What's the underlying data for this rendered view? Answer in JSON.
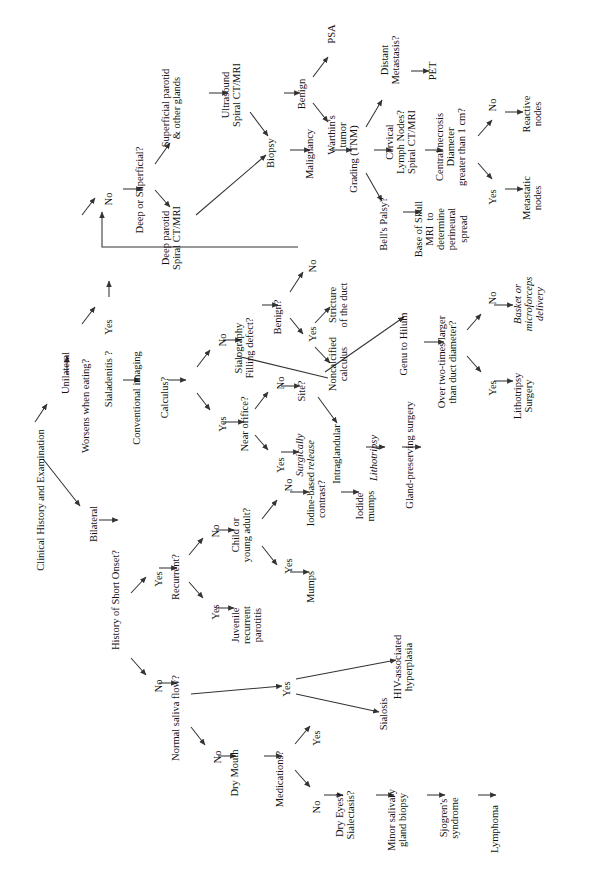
{
  "figure": {
    "type": "flowchart",
    "orientation": "rotated-90-ccw",
    "background": "#ffffff",
    "line_color": "#333333",
    "text_color": "#111111"
  },
  "nodes": {
    "root": "Clinical History and Examination",
    "unilateral": "Unilateral",
    "bilateral": "Bilateral",
    "worsens_eating": "Worsens when eating?",
    "we_yes": "Yes",
    "we_no": "No",
    "sialadenitis": "Sialadenitis ?",
    "conventional_imaging": "Conventional imaging",
    "calculus_q": "Calculus?",
    "calc_no": "No",
    "calc_yes": "Yes",
    "sialography": "Sialography\nFilling defect?",
    "benign_q": "Benign?",
    "benign_no": "No",
    "benign_yes": "Yes",
    "stricture": "Stricture\nof the duct",
    "noncalcified": "Noncalcified\ncalculus",
    "near_orifice": "Near orifice?",
    "no_no": "No",
    "no_yes": "Yes",
    "surgically_release": "Surgically\nrelease",
    "site_q": "Site?",
    "intraglandular": "Intraglandular",
    "lithotripsy1": "Lithotripsy",
    "gland_preserving": "Gland-preserving surgery",
    "genu_hilum": "Genu to Hilum",
    "over_two_times": "Over two-times larger\nthan duct diameter?",
    "ott_no": "No",
    "ott_yes": "Yes",
    "basket": "Basket or\nmicroforceps\ndelivery",
    "lithotripsy2": "Lithotripsy\nSurgery",
    "deep_or_superficial": "Deep or Superficial?",
    "superficial_parotid": "Superficial parotid\n& other glands",
    "deep_parotid": "Deep parotid\nSpiral CT/MRI",
    "ultrasound": "Ultrasound\nSpiral CT/MRI",
    "biopsy": "Biopsy",
    "benign": "Benign",
    "psa": "PSA",
    "warthins": "Warthin's\ntumor",
    "malignancy": "Malignancy",
    "grading": "Grading (TNM)",
    "distant_mets": "Distant\nMetastasis?",
    "pet": "PET",
    "cervical_nodes": "Cervical\nLymph Nodes?\nSpiral CT/MRI",
    "central_necrosis": "Central necrosis\nDiameter\ngreater than 1 cm?",
    "cn_no": "No",
    "cn_yes": "Yes",
    "reactive_nodes": "Reactive\nnodes",
    "metastatic_nodes": "Metastatic\nnodes",
    "bells_palsy": "Bell's Palsy?",
    "base_of_skull": "Base of Skull\nMRI  to\ndetermine\nperineural\nspread",
    "short_onset": "History of Short Onset?",
    "so_yes": "Yes",
    "so_no": "No",
    "recurrent_q": "Recurrent?",
    "rec_no": "No",
    "rec_yes": "Yes",
    "juvenile": "Juvenile\nrecurrent\nparotitis",
    "child_young": "Child or\nyoung adult?",
    "cy_no": "No",
    "cy_yes": "Yes",
    "mumps": "Mumps",
    "iodine_contrast": "Iodine-based\ncontrast?",
    "iodide_mumps": "Iodide\nmumps",
    "normal_saliva": "Normal saliva flow?",
    "ns_yes": "Yes",
    "ns_no": "No",
    "hiv": "HIV-associated\nhyperplasia",
    "sialosis": "Sialosis",
    "dry_mouth": "Dry Mouth",
    "medications": "Medications?",
    "med_yes": "Yes",
    "med_no": "No",
    "dry_eyes": "Dry Eyes?\nSialectasis?",
    "minor_biopsy": "Minor salivary\ngland biopsy",
    "sjogrens": "Sjogren's\nsyndrome",
    "lymphoma": "Lymphoma"
  },
  "edges": [
    {
      "from": "root",
      "to": "unilateral",
      "label": ""
    },
    {
      "from": "root",
      "to": "bilateral",
      "label": ""
    },
    {
      "from": "unilateral",
      "to": "worsens_eating",
      "label": ""
    },
    {
      "from": "worsens_eating",
      "to": "we_yes",
      "label": ""
    },
    {
      "from": "worsens_eating",
      "to": "we_no",
      "label": ""
    },
    {
      "from": "we_yes",
      "to": "sialadenitis",
      "label": ""
    },
    {
      "from": "sialadenitis",
      "to": "conventional_imaging",
      "label": ""
    },
    {
      "from": "conventional_imaging",
      "to": "calculus_q",
      "label": ""
    },
    {
      "from": "calculus_q",
      "to": "calc_no",
      "label": ""
    },
    {
      "from": "calculus_q",
      "to": "calc_yes",
      "label": ""
    },
    {
      "from": "calc_no",
      "to": "sialography",
      "label": ""
    },
    {
      "from": "sialography",
      "to": "benign_q",
      "label": ""
    },
    {
      "from": "benign_q",
      "to": "benign_no",
      "label": ""
    },
    {
      "from": "benign_q",
      "to": "benign_yes",
      "label": ""
    },
    {
      "from": "benign_no",
      "to": "we_no",
      "label": "elbow feedback"
    },
    {
      "from": "benign_yes",
      "to": "stricture",
      "label": ""
    },
    {
      "from": "benign_yes",
      "to": "noncalcified",
      "label": ""
    },
    {
      "from": "calc_yes",
      "to": "near_orifice",
      "label": ""
    },
    {
      "from": "near_orifice",
      "to": "no_no",
      "label": ""
    },
    {
      "from": "near_orifice",
      "to": "no_yes",
      "label": ""
    },
    {
      "from": "no_yes",
      "to": "surgically_release",
      "label": ""
    },
    {
      "from": "no_no",
      "to": "site_q",
      "label": ""
    },
    {
      "from": "noncalcified",
      "to": "site_q",
      "label": "diagonal"
    },
    {
      "from": "site_q",
      "to": "intraglandular",
      "label": ""
    },
    {
      "from": "site_q",
      "to": "genu_hilum",
      "label": ""
    },
    {
      "from": "intraglandular",
      "to": "lithotripsy1",
      "label": ""
    },
    {
      "from": "lithotripsy1",
      "to": "gland_preserving",
      "label": ""
    },
    {
      "from": "genu_hilum",
      "to": "over_two_times",
      "label": ""
    },
    {
      "from": "over_two_times",
      "to": "ott_no",
      "label": ""
    },
    {
      "from": "over_two_times",
      "to": "ott_yes",
      "label": ""
    },
    {
      "from": "ott_no",
      "to": "basket",
      "label": ""
    },
    {
      "from": "ott_yes",
      "to": "lithotripsy2",
      "label": ""
    },
    {
      "from": "we_no",
      "to": "deep_or_superficial",
      "label": ""
    },
    {
      "from": "deep_or_superficial",
      "to": "superficial_parotid",
      "label": ""
    },
    {
      "from": "deep_or_superficial",
      "to": "deep_parotid",
      "label": ""
    },
    {
      "from": "superficial_parotid",
      "to": "ultrasound",
      "label": ""
    },
    {
      "from": "ultrasound",
      "to": "biopsy",
      "label": ""
    },
    {
      "from": "deep_parotid",
      "to": "biopsy",
      "label": ""
    },
    {
      "from": "biopsy",
      "to": "benign",
      "label": ""
    },
    {
      "from": "biopsy",
      "to": "malignancy",
      "label": ""
    },
    {
      "from": "benign",
      "to": "psa",
      "label": ""
    },
    {
      "from": "benign",
      "to": "warthins",
      "label": ""
    },
    {
      "from": "malignancy",
      "to": "grading",
      "label": ""
    },
    {
      "from": "grading",
      "to": "distant_mets",
      "label": ""
    },
    {
      "from": "grading",
      "to": "cervical_nodes",
      "label": ""
    },
    {
      "from": "grading",
      "to": "bells_palsy",
      "label": ""
    },
    {
      "from": "distant_mets",
      "to": "pet",
      "label": ""
    },
    {
      "from": "cervical_nodes",
      "to": "central_necrosis",
      "label": ""
    },
    {
      "from": "central_necrosis",
      "to": "cn_no",
      "label": ""
    },
    {
      "from": "central_necrosis",
      "to": "cn_yes",
      "label": ""
    },
    {
      "from": "cn_no",
      "to": "reactive_nodes",
      "label": ""
    },
    {
      "from": "cn_yes",
      "to": "metastatic_nodes",
      "label": ""
    },
    {
      "from": "bells_palsy",
      "to": "base_of_skull",
      "label": ""
    },
    {
      "from": "bilateral",
      "to": "short_onset",
      "label": ""
    },
    {
      "from": "short_onset",
      "to": "so_yes",
      "label": ""
    },
    {
      "from": "short_onset",
      "to": "so_no",
      "label": ""
    },
    {
      "from": "so_yes",
      "to": "recurrent_q",
      "label": ""
    },
    {
      "from": "recurrent_q",
      "to": "rec_no",
      "label": ""
    },
    {
      "from": "recurrent_q",
      "to": "rec_yes",
      "label": ""
    },
    {
      "from": "rec_yes",
      "to": "juvenile",
      "label": ""
    },
    {
      "from": "rec_no",
      "to": "child_young",
      "label": ""
    },
    {
      "from": "child_young",
      "to": "cy_yes",
      "label": ""
    },
    {
      "from": "child_young",
      "to": "cy_no",
      "label": ""
    },
    {
      "from": "cy_yes",
      "to": "mumps",
      "label": ""
    },
    {
      "from": "cy_no",
      "to": "iodine_contrast",
      "label": ""
    },
    {
      "from": "iodine_contrast",
      "to": "iodide_mumps",
      "label": ""
    },
    {
      "from": "so_no",
      "to": "normal_saliva",
      "label": ""
    },
    {
      "from": "normal_saliva",
      "to": "ns_yes",
      "label": ""
    },
    {
      "from": "normal_saliva",
      "to": "ns_no",
      "label": ""
    },
    {
      "from": "ns_yes",
      "to": "hiv",
      "label": ""
    },
    {
      "from": "ns_yes",
      "to": "sialosis",
      "label": ""
    },
    {
      "from": "ns_no",
      "to": "dry_mouth",
      "label": ""
    },
    {
      "from": "dry_mouth",
      "to": "medications",
      "label": ""
    },
    {
      "from": "medications",
      "to": "med_yes",
      "label": ""
    },
    {
      "from": "medications",
      "to": "med_no",
      "label": ""
    },
    {
      "from": "med_no",
      "to": "dry_eyes",
      "label": ""
    },
    {
      "from": "dry_eyes",
      "to": "minor_biopsy",
      "label": ""
    },
    {
      "from": "minor_biopsy",
      "to": "sjogrens",
      "label": ""
    },
    {
      "from": "sjogrens",
      "to": "lymphoma",
      "label": ""
    }
  ]
}
